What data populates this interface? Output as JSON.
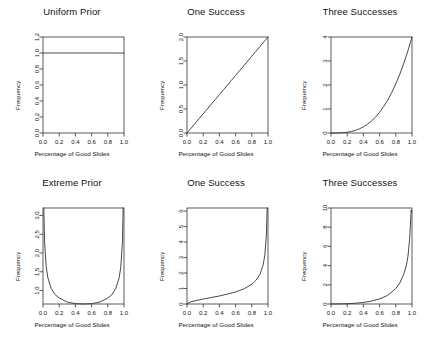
{
  "figure": {
    "layout": "2 rows x 3 columns",
    "background": "#ffffff",
    "line_color": "#333333",
    "axis_color": "#333333"
  },
  "chart_data": [
    {
      "type": "line",
      "title": "Uniform Prior",
      "xlabel": "Percentage of Good Slides",
      "ylabel": "Frequency",
      "xlim": [
        0.0,
        1.0
      ],
      "ylim": [
        0.0,
        1.2
      ],
      "xticks": [
        "0.0",
        "0.2",
        "0.4",
        "0.6",
        "0.8",
        "1.0"
      ],
      "xtickvals": [
        0.0,
        0.2,
        0.4,
        0.6,
        0.8,
        1.0
      ],
      "yticks": [
        "0.0",
        "0.2",
        "0.4",
        "0.6",
        "0.8",
        "1.0",
        "1.2"
      ],
      "ytickvals": [
        0.0,
        0.2,
        0.4,
        0.6,
        0.8,
        1.0,
        1.2
      ],
      "grid": false,
      "legend": "none",
      "curve": "Beta(1,1) density, constant 1.0",
      "x": [
        0.0,
        0.05,
        0.1,
        0.15,
        0.2,
        0.25,
        0.3,
        0.35,
        0.4,
        0.45,
        0.5,
        0.55,
        0.6,
        0.65,
        0.7,
        0.75,
        0.8,
        0.85,
        0.9,
        0.95,
        1.0
      ],
      "y": [
        1,
        1,
        1,
        1,
        1,
        1,
        1,
        1,
        1,
        1,
        1,
        1,
        1,
        1,
        1,
        1,
        1,
        1,
        1,
        1,
        1
      ]
    },
    {
      "type": "line",
      "title": "One Success",
      "xlabel": "Percentage of Good Slides",
      "ylabel": "Frequency",
      "xlim": [
        0.0,
        1.0
      ],
      "ylim": [
        0.0,
        2.0
      ],
      "xticks": [
        "0.0",
        "0.2",
        "0.4",
        "0.6",
        "0.8",
        "1.0"
      ],
      "xtickvals": [
        0.0,
        0.2,
        0.4,
        0.6,
        0.8,
        1.0
      ],
      "yticks": [
        "0.0",
        "0.5",
        "1.0",
        "1.5",
        "2.0"
      ],
      "ytickvals": [
        0.0,
        0.5,
        1.0,
        1.5,
        2.0
      ],
      "grid": false,
      "legend": "none",
      "curve": "Beta(2,1) density, y = 2x",
      "x": [
        0.0,
        0.05,
        0.1,
        0.15,
        0.2,
        0.25,
        0.3,
        0.35,
        0.4,
        0.45,
        0.5,
        0.55,
        0.6,
        0.65,
        0.7,
        0.75,
        0.8,
        0.85,
        0.9,
        0.95,
        1.0
      ],
      "y": [
        0.0,
        0.1,
        0.2,
        0.3,
        0.4,
        0.5,
        0.6,
        0.7,
        0.8,
        0.9,
        1.0,
        1.1,
        1.2,
        1.3,
        1.4,
        1.5,
        1.6,
        1.7,
        1.8,
        1.9,
        2.0
      ]
    },
    {
      "type": "line",
      "title": "Three Successes",
      "xlabel": "Percentage of Good Slides",
      "ylabel": "Frequency",
      "xlim": [
        0.0,
        1.0
      ],
      "ylim": [
        0,
        4
      ],
      "xticks": [
        "0.0",
        "0.2",
        "0.4",
        "0.6",
        "0.8",
        "1.0"
      ],
      "xtickvals": [
        0.0,
        0.2,
        0.4,
        0.6,
        0.8,
        1.0
      ],
      "yticks": [
        "0",
        "1",
        "2",
        "3",
        "4"
      ],
      "ytickvals": [
        0,
        1,
        2,
        3,
        4
      ],
      "grid": false,
      "legend": "none",
      "curve": "Beta(4,1) density, y = 4x^3",
      "x": [
        0.0,
        0.05,
        0.1,
        0.15,
        0.2,
        0.25,
        0.3,
        0.35,
        0.4,
        0.45,
        0.5,
        0.55,
        0.6,
        0.65,
        0.7,
        0.75,
        0.8,
        0.85,
        0.9,
        0.95,
        1.0
      ],
      "y": [
        0.0,
        0.001,
        0.004,
        0.014,
        0.032,
        0.063,
        0.108,
        0.172,
        0.256,
        0.365,
        0.5,
        0.666,
        0.864,
        1.099,
        1.372,
        1.688,
        2.048,
        2.457,
        2.916,
        3.43,
        4.0
      ]
    },
    {
      "type": "line",
      "title": "Extreme Prior",
      "xlabel": "Percentage of Good Slides",
      "ylabel": "Frequency",
      "xlim": [
        0.0,
        1.0
      ],
      "ylim": [
        0.64,
        3.2
      ],
      "xticks": [
        "0.0",
        "0.2",
        "0.4",
        "0.6",
        "0.8",
        "1.0"
      ],
      "xtickvals": [
        0.0,
        0.2,
        0.4,
        0.6,
        0.8,
        1.0
      ],
      "yticks": [
        "1.0",
        "1.5",
        "2.0",
        "2.5",
        "3.0"
      ],
      "ytickvals": [
        1.0,
        1.5,
        2.0,
        2.5,
        3.0
      ],
      "grid": false,
      "legend": "none",
      "curve": "Beta(0.5,0.5) density, U-shaped, y = 1/(pi*sqrt(x(1-x)))",
      "x": [
        0.01,
        0.02,
        0.04,
        0.06,
        0.1,
        0.15,
        0.2,
        0.3,
        0.4,
        0.5,
        0.6,
        0.7,
        0.8,
        0.85,
        0.9,
        0.94,
        0.96,
        0.98,
        0.99
      ],
      "y": [
        3.2,
        2.27,
        1.62,
        1.34,
        1.06,
        0.89,
        0.8,
        0.69,
        0.65,
        0.637,
        0.65,
        0.69,
        0.8,
        0.89,
        1.06,
        1.34,
        1.62,
        2.27,
        3.2
      ]
    },
    {
      "type": "line",
      "title": "One Success",
      "xlabel": "Percentage of Good Slides",
      "ylabel": "Frequency",
      "xlim": [
        0.0,
        1.0
      ],
      "ylim": [
        0,
        6.2
      ],
      "xticks": [
        "0.0",
        "0.2",
        "0.4",
        "0.6",
        "0.8",
        "1.0"
      ],
      "xtickvals": [
        0.0,
        0.2,
        0.4,
        0.6,
        0.8,
        1.0
      ],
      "yticks": [
        "0",
        "1",
        "2",
        "3",
        "4",
        "5",
        "6"
      ],
      "ytickvals": [
        0,
        1,
        2,
        3,
        4,
        5,
        6
      ],
      "grid": false,
      "legend": "none",
      "curve": "Beta(1.5,0.5) density, y = (2/pi)*sqrt(x/(1-x))",
      "x": [
        0.0,
        0.05,
        0.1,
        0.2,
        0.3,
        0.4,
        0.5,
        0.6,
        0.7,
        0.8,
        0.85,
        0.9,
        0.94,
        0.96,
        0.98,
        0.99,
        0.995
      ],
      "y": [
        0.0,
        0.15,
        0.21,
        0.32,
        0.42,
        0.52,
        0.64,
        0.78,
        0.97,
        1.27,
        1.52,
        1.91,
        2.52,
        3.12,
        4.46,
        6.33,
        6.3
      ]
    },
    {
      "type": "line",
      "title": "Three Successes",
      "xlabel": "Percentage of Good Slides",
      "ylabel": "Frequency",
      "xlim": [
        0.0,
        1.0
      ],
      "ylim": [
        0,
        10
      ],
      "xticks": [
        "0.0",
        "0.2",
        "0.4",
        "0.6",
        "0.8",
        "1.0"
      ],
      "xtickvals": [
        0.0,
        0.2,
        0.4,
        0.6,
        0.8,
        1.0
      ],
      "yticks": [
        "0",
        "2",
        "4",
        "6",
        "8",
        "10"
      ],
      "ytickvals": [
        0,
        2,
        4,
        6,
        8,
        10
      ],
      "grid": false,
      "legend": "none",
      "curve": "Beta(3.5,0.5) density, sharply peaked near 1",
      "x": [
        0.0,
        0.1,
        0.2,
        0.3,
        0.4,
        0.5,
        0.6,
        0.7,
        0.8,
        0.85,
        0.9,
        0.93,
        0.95,
        0.97,
        0.98,
        0.99,
        0.995
      ],
      "y": [
        0.0,
        0.01,
        0.03,
        0.08,
        0.16,
        0.3,
        0.53,
        0.9,
        1.62,
        2.2,
        3.15,
        4.0,
        4.95,
        6.7,
        8.2,
        9.8,
        9.6
      ]
    }
  ]
}
